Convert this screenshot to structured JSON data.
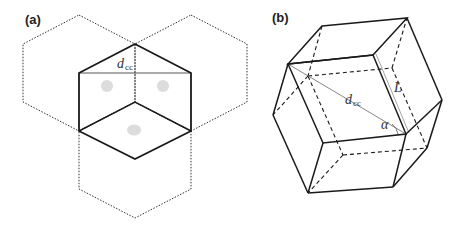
{
  "panels": {
    "a": {
      "label": "(a)",
      "dimension_label": "d",
      "dimension_sub": "cc"
    },
    "b": {
      "label": "(b)",
      "dimension_label": "d",
      "dimension_sub": "cc",
      "length_label": "L",
      "angle_label": "α"
    }
  },
  "colors": {
    "line": "#1a1a1a",
    "guide": "#888888",
    "dot": "#d8d8d8"
  }
}
